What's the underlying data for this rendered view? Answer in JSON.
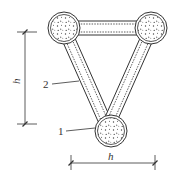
{
  "diagram": {
    "type": "triangular concrete column cross-section with struts",
    "nodes": [
      {
        "id": "top-left",
        "shape": "circle",
        "fill": "concrete"
      },
      {
        "id": "top-right",
        "shape": "circle",
        "fill": "concrete"
      },
      {
        "id": "bottom",
        "shape": "circle",
        "fill": "concrete",
        "label": "1"
      }
    ],
    "struts": [
      {
        "from": "top-left",
        "to": "top-right",
        "orientation": "horizontal"
      },
      {
        "from": "top-left",
        "to": "bottom",
        "label": "2"
      },
      {
        "from": "top-right",
        "to": "bottom"
      }
    ],
    "labels": {
      "callout_1": "1",
      "callout_2": "2",
      "dim_vertical": "h",
      "dim_horizontal": "h"
    },
    "colors": {
      "line": "#333333",
      "background": "#ffffff"
    }
  }
}
